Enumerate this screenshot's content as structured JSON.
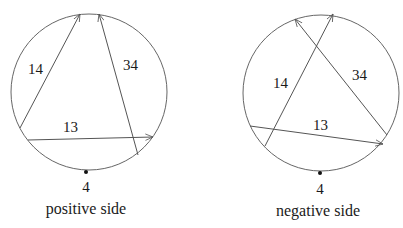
{
  "panels": [
    {
      "caption": "positive side",
      "point_label": "4",
      "circle": {
        "cx": 89,
        "cy": 92,
        "r": 78
      },
      "point": {
        "x": 86,
        "y": 172
      },
      "arrows": [
        {
          "label": "14",
          "x1": 20,
          "y1": 128,
          "x2": 80,
          "y2": 14,
          "lx": 36,
          "ly": 74
        },
        {
          "label": "34",
          "x1": 138,
          "y1": 155,
          "x2": 99,
          "y2": 14,
          "lx": 124,
          "ly": 70
        },
        {
          "label": "13",
          "x1": 28,
          "y1": 140,
          "x2": 153,
          "y2": 137,
          "lx": 63,
          "ly": 132
        }
      ]
    },
    {
      "caption": "negative side",
      "point_label": "4",
      "circle": {
        "cx": 321,
        "cy": 93,
        "r": 78
      },
      "point": {
        "x": 320,
        "y": 173
      },
      "arrows": [
        {
          "label": "14",
          "x1": 265,
          "y1": 146,
          "x2": 333,
          "y2": 14,
          "lx": 274,
          "ly": 88
        },
        {
          "label": "34",
          "x1": 387,
          "y1": 135,
          "x2": 295,
          "y2": 19,
          "lx": 352,
          "ly": 80
        },
        {
          "label": "13",
          "x1": 250,
          "y1": 126,
          "x2": 383,
          "y2": 144,
          "lx": 312,
          "ly": 130
        }
      ]
    }
  ],
  "colors": {
    "stroke": "#555555",
    "text": "#1a1a1a"
  }
}
